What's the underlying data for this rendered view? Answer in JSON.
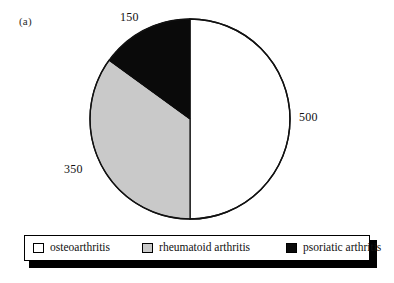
{
  "figure": {
    "panel_letter": "(a)"
  },
  "chart_data": {
    "type": "pie",
    "title": "",
    "subtitle": "",
    "xlabel": "",
    "ylabel": "",
    "grid": false,
    "legend_position": "bottom",
    "total": 1000,
    "categories": [
      "osteoarthritis",
      "rheumatoid arthritis",
      "psoriatic arthritis"
    ],
    "values": [
      500,
      350,
      150
    ],
    "value_labels": [
      "500",
      "350",
      "150"
    ],
    "percentages": [
      50,
      35,
      15
    ],
    "angles_deg": [
      180,
      126,
      54
    ],
    "colors": [
      "#ffffff",
      "#c9c9c9",
      "#0a0a0a"
    ],
    "slice_border_color": "#111111",
    "start_angle_deg": 0,
    "direction": "clockwise",
    "slices": [
      {
        "label": "osteoarthritis",
        "value": 500,
        "value_label": "500",
        "percent": 50,
        "color": "#ffffff"
      },
      {
        "label": "rheumatoid arthritis",
        "value": 350,
        "value_label": "350",
        "percent": 35,
        "color": "#c9c9c9"
      },
      {
        "label": "psoriatic arthritis",
        "value": 150,
        "value_label": "150",
        "percent": 15,
        "color": "#0a0a0a"
      }
    ]
  },
  "legend": {
    "items": [
      {
        "label": "osteoarthritis",
        "color": "#ffffff"
      },
      {
        "label": "rheumatoid arthritis",
        "color": "#c9c9c9"
      },
      {
        "label": "psoriatic arthritis",
        "color": "#0a0a0a"
      }
    ]
  }
}
